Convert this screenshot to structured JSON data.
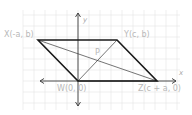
{
  "figure": {
    "type": "coordinate-geometry-parallelogram",
    "axes": {
      "x_label": "x",
      "y_label": "y"
    },
    "points": [
      {
        "id": "X",
        "label": "X(-a, b)",
        "px": 38,
        "py": 40
      },
      {
        "id": "Y",
        "label": "Y(c, b)",
        "px": 117,
        "py": 40
      },
      {
        "id": "W",
        "label": "W(0, 0)",
        "px": 78,
        "py": 81
      },
      {
        "id": "Z",
        "label": "Z(c + a, 0)",
        "px": 157,
        "py": 81
      }
    ],
    "intersection": {
      "id": "P",
      "label": "P",
      "px": 97,
      "py": 61
    },
    "shape": "parallelogram XYZW",
    "diagonals": [
      "XZ",
      "YW"
    ],
    "colors": {
      "edge": "#1a1a1a",
      "grid": "#e4e4e4",
      "label": "#b8b8b8"
    }
  }
}
